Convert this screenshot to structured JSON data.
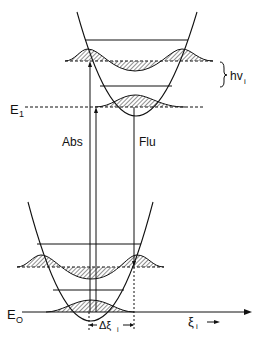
{
  "diagram": {
    "labels": {
      "e1": "E",
      "e1_sub": "1",
      "e0": "E",
      "e0_sub": "O",
      "abs": "Abs",
      "flu": "Flu",
      "hv": "hv",
      "hv_sub": "i",
      "delta_xi": "Δξ",
      "delta_xi_sub": "i",
      "xi_axis": "ξ",
      "xi_axis_sub": "i"
    },
    "colors": {
      "line": "#111111",
      "hatch": "#222222",
      "background": "#ffffff"
    }
  }
}
